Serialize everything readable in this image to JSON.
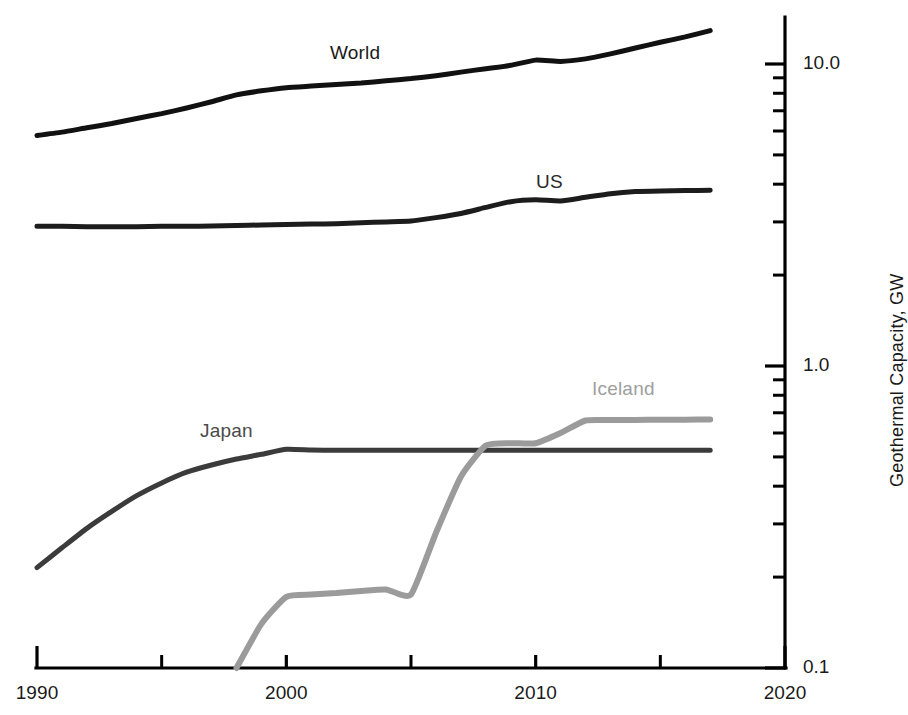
{
  "chart_data": {
    "type": "line",
    "title": "",
    "xlabel": "",
    "ylabel": "Geothermal Capacity, GW",
    "yscale": "log",
    "xscale": "linear",
    "xlim": [
      1990,
      2020
    ],
    "ylim": [
      0.1,
      15.2
    ],
    "grid": false,
    "legend_position": "inline-labels",
    "x_ticks": [
      1990,
      1995,
      2000,
      2005,
      2010,
      2015,
      2020
    ],
    "x_tick_labels": [
      "1990",
      "",
      "2000",
      "",
      "2010",
      "",
      "2020"
    ],
    "y_ticks_major": [
      0.1,
      1.0,
      10.0
    ],
    "y_tick_labels": [
      "0.1",
      "1.0",
      "10.0"
    ],
    "y_ticks_minor": [
      0.2,
      0.3,
      0.4,
      0.5,
      0.6,
      0.7,
      0.8,
      0.9,
      2,
      3,
      4,
      5,
      6,
      7,
      8,
      9
    ],
    "x": [
      1990,
      1991,
      1992,
      1993,
      1994,
      1995,
      1996,
      1997,
      1998,
      1999,
      2000,
      2001,
      2002,
      2003,
      2004,
      2005,
      2006,
      2007,
      2008,
      2009,
      2010,
      2011,
      2012,
      2013,
      2014,
      2015,
      2016,
      2017
    ],
    "series": [
      {
        "name": "World",
        "color": "#111111",
        "width": 5.0,
        "label_x": 330,
        "label_y": 42,
        "label_color": "#1a1a1a",
        "values": [
          5.8,
          5.95,
          6.15,
          6.35,
          6.6,
          6.85,
          7.15,
          7.5,
          7.9,
          8.15,
          8.35,
          8.45,
          8.55,
          8.65,
          8.8,
          8.95,
          9.15,
          9.4,
          9.65,
          9.9,
          10.3,
          10.2,
          10.4,
          10.8,
          11.3,
          11.8,
          12.3,
          12.9
        ]
      },
      {
        "name": "US",
        "color": "#1c1c1c",
        "width": 5.0,
        "label_x": 536,
        "label_y": 171,
        "label_color": "#2a2a2a",
        "values": [
          2.9,
          2.9,
          2.89,
          2.89,
          2.89,
          2.9,
          2.9,
          2.91,
          2.92,
          2.93,
          2.94,
          2.95,
          2.96,
          2.98,
          3.0,
          3.02,
          3.1,
          3.2,
          3.35,
          3.5,
          3.55,
          3.52,
          3.62,
          3.72,
          3.78,
          3.8,
          3.81,
          3.82
        ]
      },
      {
        "name": "Japan",
        "color": "#3b3b3b",
        "width": 5.0,
        "label_x": 200,
        "label_y": 420,
        "label_color": "#4a4a4a",
        "values": [
          0.215,
          0.25,
          0.29,
          0.33,
          0.372,
          0.41,
          0.445,
          0.47,
          0.492,
          0.51,
          0.53,
          0.527,
          0.526,
          0.526,
          0.526,
          0.526,
          0.526,
          0.526,
          0.526,
          0.526,
          0.526,
          0.526,
          0.526,
          0.526,
          0.526,
          0.526,
          0.526,
          0.526
        ]
      },
      {
        "name": "Iceland",
        "color": "#9b9b9b",
        "width": 6.0,
        "label_x": 592,
        "label_y": 378,
        "label_color": "#9e9e9e",
        "start_index": 8,
        "values": [
          null,
          null,
          null,
          null,
          null,
          null,
          null,
          null,
          0.098,
          0.14,
          0.172,
          0.175,
          0.177,
          0.18,
          0.182,
          0.175,
          0.28,
          0.43,
          0.545,
          0.555,
          0.555,
          0.6,
          0.66,
          0.662,
          0.663,
          0.664,
          0.664,
          0.665
        ]
      }
    ]
  },
  "axes": {
    "y_title": "Geothermal Capacity, GW",
    "y_labels": [
      {
        "text": "10.0",
        "value": 10.0
      },
      {
        "text": "1.0",
        "value": 1.0
      },
      {
        "text": "0.1",
        "value": 0.1
      }
    ],
    "x_labels": [
      {
        "text": "1990",
        "value": 1990
      },
      {
        "text": "2000",
        "value": 2000
      },
      {
        "text": "2010",
        "value": 2010
      },
      {
        "text": "2020",
        "value": 2020
      }
    ]
  },
  "colors": {
    "axis": "#000000",
    "world": "#111111",
    "us": "#1c1c1c",
    "japan": "#3b3b3b",
    "iceland": "#9b9b9b",
    "background": "#ffffff"
  }
}
